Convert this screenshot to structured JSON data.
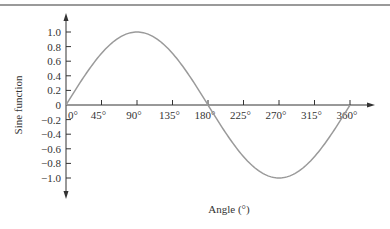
{
  "chart_data": {
    "type": "line",
    "title": "",
    "xlabel": "Angle (°)",
    "ylabel": "Sine function",
    "x_ticks": [
      "0°",
      "45°",
      "90°",
      "135°",
      "180°",
      "225°",
      "270°",
      "315°",
      "360°"
    ],
    "x_tick_values": [
      0,
      45,
      90,
      135,
      180,
      225,
      270,
      315,
      360
    ],
    "y_ticks": [
      "1.0",
      "0.8",
      "0.6",
      "0.4",
      "0.2",
      "0",
      "−0.2",
      "−0.4",
      "−0.6",
      "−0.8",
      "−1.0"
    ],
    "y_tick_values": [
      1.0,
      0.8,
      0.6,
      0.4,
      0.2,
      0,
      -0.2,
      -0.4,
      -0.6,
      -0.8,
      -1.0
    ],
    "xlim": [
      0,
      360
    ],
    "ylim": [
      -1.0,
      1.0
    ],
    "grid": false,
    "legend": null,
    "series": [
      {
        "name": "sin(θ)",
        "x": [
          0,
          45,
          90,
          135,
          180,
          225,
          270,
          315,
          360
        ],
        "values": [
          0,
          0.707,
          1.0,
          0.707,
          0,
          -0.707,
          -1.0,
          -0.707,
          0
        ]
      }
    ],
    "colors": {
      "curve": "#9a9a9a",
      "axes": "#333333"
    }
  }
}
